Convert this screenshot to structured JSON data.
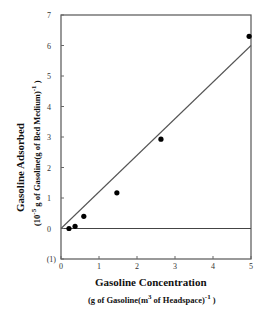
{
  "chart_data": {
    "type": "scatter",
    "title": "",
    "xlabel": "Gasoline Concentration",
    "xlabel_units": "(g of Gasoline(m3 of Headspace)-1 )",
    "ylabel": "Gasoline Adsorbed",
    "ylabel_units": "(10-5 g of Gasoline(g of Bed Medium)-1 )",
    "xlim": [
      0,
      5
    ],
    "ylim": [
      -1,
      7
    ],
    "xticks": [
      "0",
      "1",
      "2",
      "3",
      "4",
      "5"
    ],
    "yticks": [
      "(1)",
      "0",
      "1",
      "2",
      "3",
      "4",
      "5",
      "6",
      "7"
    ],
    "grid": false,
    "legend": null,
    "series": [
      {
        "name": "Measured",
        "type": "scatter",
        "x": [
          0.21,
          0.37,
          0.6,
          1.47,
          2.63,
          4.95
        ],
        "y": [
          0.0,
          0.07,
          0.4,
          1.17,
          2.93,
          6.3
        ]
      },
      {
        "name": "Linear fit",
        "type": "line",
        "x": [
          0,
          5
        ],
        "y": [
          0,
          6.0
        ]
      }
    ],
    "reference_lines": [
      {
        "axis": "y",
        "value": 0
      }
    ]
  },
  "labels": {
    "y_title": "Gasoline Adsorbed",
    "y_units_pre": "(10",
    "y_units_exp": "-5",
    "y_units_mid": " g of Gasoline(g of Bed Medium)",
    "y_units_exp2": "-1",
    "y_units_post": " )",
    "x_title": "Gasoline Concentration",
    "x_units_pre": "(g of Gasoline(m",
    "x_units_exp": "3",
    "x_units_mid": "  of Headspace)",
    "x_units_exp2": "-1",
    "x_units_post": " )"
  }
}
